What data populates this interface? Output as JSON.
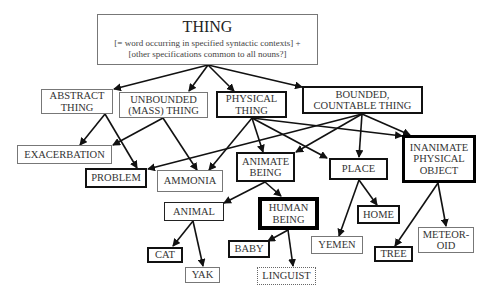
{
  "diagram": {
    "root": {
      "title": "THING",
      "line1": "[= word occurring in specified syntactic contexts] +",
      "line2": "[other specifications common to all nouns?]"
    },
    "nodes": {
      "abstract_thing": {
        "l1": "ABSTRACT",
        "l2": "THING"
      },
      "unbounded_thing": {
        "l1": "UNBOUNDED",
        "l2": "(MASS) THING"
      },
      "physical_thing": {
        "l1": "PHYSICAL",
        "l2": "THING"
      },
      "bounded_thing": {
        "l1": "BOUNDED,",
        "l2": "COUNTABLE THING"
      },
      "exacerbation": {
        "l1": "EXACERBATION"
      },
      "problem": {
        "l1": "PROBLEM"
      },
      "ammonia": {
        "l1": "AMMONIA"
      },
      "animate_being": {
        "l1": "ANIMATE",
        "l2": "BEING"
      },
      "place": {
        "l1": "PLACE"
      },
      "inanimate_object": {
        "l1": "INANIMATE",
        "l2": "PHYSICAL",
        "l3": "OBJECT"
      },
      "animal": {
        "l1": "ANIMAL"
      },
      "human_being": {
        "l1": "HUMAN",
        "l2": "BEING"
      },
      "home": {
        "l1": "HOME"
      },
      "yemen": {
        "l1": "YEMEN"
      },
      "cat": {
        "l1": "CAT"
      },
      "yak": {
        "l1": "YAK"
      },
      "baby": {
        "l1": "BABY"
      },
      "linguist": {
        "l1": "LINGUIST"
      },
      "tree": {
        "l1": "TREE"
      },
      "meteoroid": {
        "l1": "METEOR-",
        "l2": "OID"
      }
    },
    "edges": [
      [
        "THING",
        "ABSTRACT THING"
      ],
      [
        "THING",
        "UNBOUNDED (MASS) THING"
      ],
      [
        "THING",
        "PHYSICAL THING"
      ],
      [
        "THING",
        "BOUNDED, COUNTABLE THING"
      ],
      [
        "ABSTRACT THING",
        "EXACERBATION"
      ],
      [
        "ABSTRACT THING",
        "PROBLEM"
      ],
      [
        "UNBOUNDED (MASS) THING",
        "EXACERBATION"
      ],
      [
        "UNBOUNDED (MASS) THING",
        "AMMONIA"
      ],
      [
        "PHYSICAL THING",
        "AMMONIA"
      ],
      [
        "PHYSICAL THING",
        "ANIMATE BEING"
      ],
      [
        "PHYSICAL THING",
        "PLACE"
      ],
      [
        "PHYSICAL THING",
        "INANIMATE PHYSICAL OBJECT"
      ],
      [
        "BOUNDED, COUNTABLE THING",
        "PROBLEM"
      ],
      [
        "BOUNDED, COUNTABLE THING",
        "ANIMATE BEING"
      ],
      [
        "BOUNDED, COUNTABLE THING",
        "PLACE"
      ],
      [
        "BOUNDED, COUNTABLE THING",
        "INANIMATE PHYSICAL OBJECT"
      ],
      [
        "ANIMATE BEING",
        "ANIMAL"
      ],
      [
        "ANIMATE BEING",
        "HUMAN BEING"
      ],
      [
        "PLACE",
        "YEMEN"
      ],
      [
        "PLACE",
        "HOME"
      ],
      [
        "INANIMATE PHYSICAL OBJECT",
        "TREE"
      ],
      [
        "INANIMATE PHYSICAL OBJECT",
        "METEOROID"
      ],
      [
        "ANIMAL",
        "CAT"
      ],
      [
        "ANIMAL",
        "YAK"
      ],
      [
        "HUMAN BEING",
        "BABY"
      ],
      [
        "HUMAN BEING",
        "LINGUIST"
      ]
    ]
  }
}
